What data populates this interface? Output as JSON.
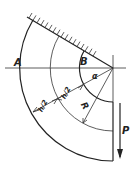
{
  "diagram": {
    "type": "curved-beam-mechanics",
    "labels": {
      "A": "A",
      "B": "B",
      "h_half_1": "h/2",
      "h_half_2": "h/2",
      "angle": "α",
      "radius": "R",
      "force": "P"
    },
    "colors": {
      "line": "#222222",
      "background": "#ffffff"
    }
  }
}
